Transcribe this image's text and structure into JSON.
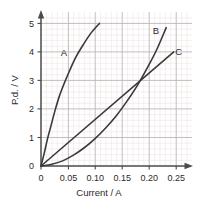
{
  "chart_data": {
    "type": "line",
    "title": "",
    "xlabel": "Current / A",
    "ylabel": "P.d. / V",
    "xlim": [
      0,
      0.25
    ],
    "ylim": [
      0,
      5
    ],
    "xticks": [
      "0",
      "0.05",
      "0.10",
      "0.15",
      "0.20",
      "0.25"
    ],
    "xtick_values": [
      0,
      0.05,
      0.1,
      0.15,
      0.2,
      0.25
    ],
    "yticks": [
      "0",
      "1",
      "2",
      "3",
      "4",
      "5"
    ],
    "ytick_values": [
      0,
      1,
      2,
      3,
      4,
      5
    ],
    "grid": "major and minor gridlines shown",
    "minor_divisions_per_major": 5,
    "legend_position": "inline curve labels",
    "series": [
      {
        "name": "A",
        "label": "A",
        "label_x": 0.0425,
        "label_y": 3.87,
        "shape": "concave-down",
        "points": [
          [
            0.0,
            0.0
          ],
          [
            0.006,
            0.45
          ],
          [
            0.012,
            0.95
          ],
          [
            0.019,
            1.45
          ],
          [
            0.026,
            1.95
          ],
          [
            0.034,
            2.45
          ],
          [
            0.043,
            2.9
          ],
          [
            0.053,
            3.35
          ],
          [
            0.064,
            3.8
          ],
          [
            0.078,
            4.25
          ],
          [
            0.092,
            4.65
          ],
          [
            0.108,
            5.0
          ]
        ]
      },
      {
        "name": "B",
        "label": "B",
        "label_x": 0.2125,
        "label_y": 4.62,
        "shape": "concave-up",
        "points": [
          [
            0.0,
            0.0
          ],
          [
            0.02,
            0.06
          ],
          [
            0.04,
            0.18
          ],
          [
            0.06,
            0.38
          ],
          [
            0.08,
            0.64
          ],
          [
            0.1,
            0.96
          ],
          [
            0.12,
            1.34
          ],
          [
            0.14,
            1.78
          ],
          [
            0.16,
            2.3
          ],
          [
            0.18,
            2.88
          ],
          [
            0.2,
            3.56
          ],
          [
            0.215,
            4.12
          ],
          [
            0.2315,
            4.85
          ]
        ]
      },
      {
        "name": "C",
        "label": "C",
        "label_x": 0.2545,
        "label_y": 3.9,
        "shape": "linear",
        "points": [
          [
            0.0,
            0.0
          ],
          [
            0.2455,
            4.0
          ]
        ]
      }
    ],
    "intersections": [
      {
        "series": [
          "B",
          "C"
        ],
        "x": 0.21,
        "y": 3.2
      }
    ],
    "colors": {
      "background": "#ffffff",
      "curve": "#3a3a3a",
      "axis": "#4a4a4a",
      "major_grid": "#b9b2b2",
      "minor_grid": "#eee4e4",
      "text": "#2b2b2b"
    }
  }
}
